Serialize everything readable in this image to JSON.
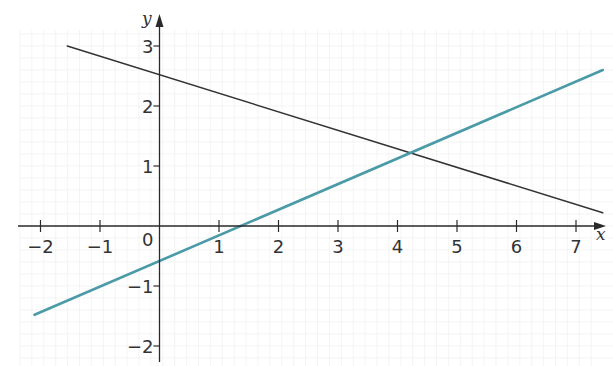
{
  "chart_data": {
    "type": "line",
    "title": "",
    "xlabel": "x",
    "ylabel": "y",
    "xlim": [
      -2.4,
      7.6
    ],
    "ylim": [
      -2.3,
      3.4
    ],
    "grid": true,
    "origin_label": "0",
    "x_ticks": [
      -2,
      -1,
      1,
      2,
      3,
      4,
      5,
      6,
      7
    ],
    "x_tick_labels": [
      "−2",
      "−1",
      "1",
      "2",
      "3",
      "4",
      "5",
      "6",
      "7"
    ],
    "y_ticks": [
      -2,
      -1,
      1,
      2,
      3
    ],
    "y_tick_labels": [
      "−2",
      "−1",
      "1",
      "2",
      "3"
    ],
    "series": [
      {
        "name": "line-dark",
        "color": "#333333",
        "x": [
          -1.55,
          7.45
        ],
        "y": [
          3.0,
          0.22
        ]
      },
      {
        "name": "line-blue",
        "color": "#4a9aa8",
        "x": [
          -2.1,
          7.45
        ],
        "y": [
          -1.48,
          2.6
        ]
      }
    ],
    "annotations": [
      {
        "type": "intersection",
        "x": 4.25,
        "y": 1.2
      }
    ]
  }
}
